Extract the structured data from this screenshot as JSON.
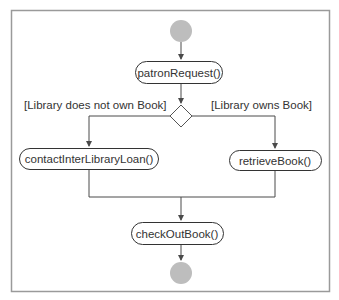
{
  "diagram": {
    "type": "UML activity diagram",
    "colors": {
      "frame": "#9a9a9a",
      "line": "#4a4a4a",
      "node_fill": "#bdbdbd",
      "text": "#333333"
    },
    "nodes": {
      "start": {
        "kind": "initial"
      },
      "patron_request": {
        "kind": "action",
        "label": "patronRequest()"
      },
      "decision": {
        "kind": "decision"
      },
      "contact_ill": {
        "kind": "action",
        "label": "contactInterLibraryLoan()"
      },
      "retrieve_book": {
        "kind": "action",
        "label": "retrieveBook()"
      },
      "check_out_book": {
        "kind": "action",
        "label": "checkOutBook()"
      },
      "end": {
        "kind": "final"
      }
    },
    "guards": {
      "not_owned": "[Library does not own Book]",
      "owned": "[Library owns Book]"
    },
    "edges": [
      {
        "from": "start",
        "to": "patron_request"
      },
      {
        "from": "patron_request",
        "to": "decision"
      },
      {
        "from": "decision",
        "to": "contact_ill",
        "guard": "[Library does not own Book]"
      },
      {
        "from": "decision",
        "to": "retrieve_book",
        "guard": "[Library owns Book]"
      },
      {
        "from": "contact_ill",
        "to": "check_out_book"
      },
      {
        "from": "retrieve_book",
        "to": "check_out_book"
      },
      {
        "from": "check_out_book",
        "to": "end"
      }
    ]
  }
}
